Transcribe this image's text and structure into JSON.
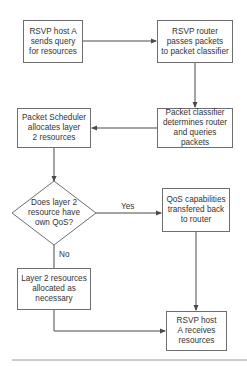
{
  "nodes": {
    "host_query": "RSVP host A\nsends query\nfor resources",
    "router_passes": "RSVP router\npasses packets\nto packet classifier",
    "classifier": "Packet classifier\ndetermines router\nand queries packets",
    "scheduler": "Packet Scheduler\nallocates layer\n2 resources",
    "decision": "Does layer 2\nresource have\nown QoS?",
    "qos_back": "QoS capabilities\ntransfered back\nto router",
    "layer2_alloc": "Layer 2 resources\nallocated as\nnecessary",
    "host_receives": "RSVP host\nA receives\nresources"
  },
  "edge_labels": {
    "yes": "Yes",
    "no": "No"
  },
  "colors": {
    "line": "#4a4a4a",
    "border": "#6e6e6e",
    "text": "#333333"
  }
}
